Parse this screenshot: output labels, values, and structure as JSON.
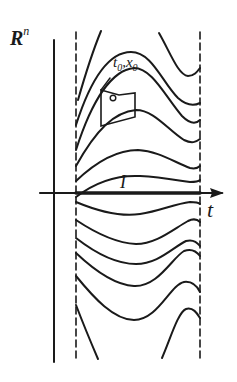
{
  "diagram": {
    "space_label": "R",
    "space_superscript": "n",
    "time_axis_label": "t",
    "interval_label": "I",
    "initial_point": {
      "t_label": "t",
      "t_sub": "0",
      "sep": ",",
      "x_label": "x",
      "x_sub": "0"
    },
    "colors": {
      "stroke": "#1a1a1a",
      "background": "#ffffff"
    }
  }
}
